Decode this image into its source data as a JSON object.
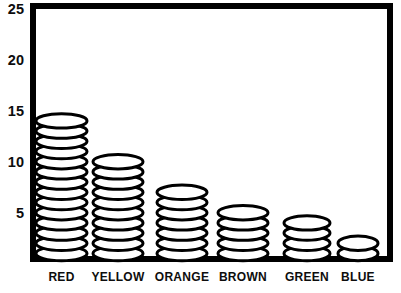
{
  "figure": {
    "background": "#ffffff"
  },
  "chart_data": {
    "type": "bar",
    "variant": "pictograph-stacked-ovals",
    "title": "",
    "xlabel": "",
    "ylabel": "",
    "categories": [
      "RED",
      "YELLOW",
      "ORANGE",
      "BROWN",
      "GREEN",
      "BLUE"
    ],
    "values": [
      14,
      10,
      7,
      5,
      4,
      2
    ],
    "unit_per_symbol": 1,
    "symbol": "oval-counter",
    "ylim": [
      0,
      25
    ],
    "yticks": [
      5,
      10,
      15,
      20,
      25
    ],
    "grid": false,
    "legend_position": "none",
    "colors": {
      "ink": "#000000",
      "symbol_fill": "#ffffff",
      "background": "#ffffff"
    }
  }
}
